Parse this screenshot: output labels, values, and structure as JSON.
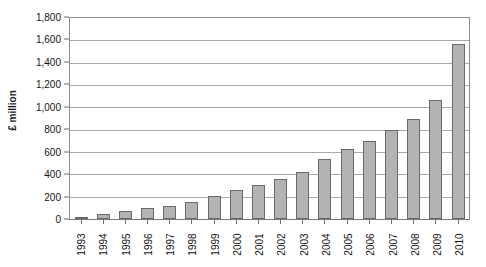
{
  "chart_data": {
    "type": "bar",
    "title": "",
    "xlabel": "",
    "ylabel": "£ million",
    "ylim": [
      0,
      1800
    ],
    "ytick_step": 200,
    "grid": true,
    "legend": "none",
    "categories": [
      "1993",
      "1994",
      "1995",
      "1996",
      "1997",
      "1998",
      "1999",
      "2000",
      "2001",
      "2002",
      "2003",
      "2004",
      "2005",
      "2006",
      "2007",
      "2008",
      "2009",
      "2010"
    ],
    "values": [
      15,
      45,
      70,
      100,
      115,
      150,
      205,
      260,
      305,
      360,
      420,
      535,
      625,
      695,
      800,
      900,
      1065,
      1570
    ],
    "ytick_labels": [
      "1,800",
      "1,600",
      "1,400",
      "1,200",
      "1,000",
      "800",
      "600",
      "400",
      "200",
      "0"
    ],
    "ytick_values": [
      1800,
      1600,
      1400,
      1200,
      1000,
      800,
      600,
      400,
      200,
      0
    ],
    "bar_color": "#b3b3b3",
    "bar_border_color": "#6a6a6a",
    "grid_color": "#a9a9a9",
    "axis_color": "#8c8c8c"
  },
  "caption": {
    "text": ""
  }
}
